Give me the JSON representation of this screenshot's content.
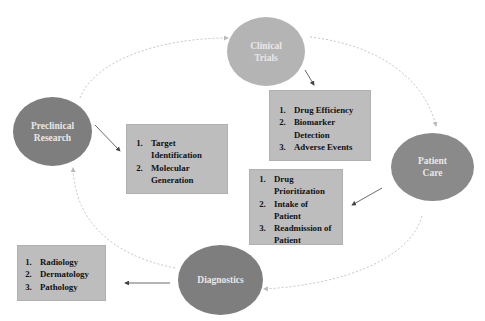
{
  "diagram": {
    "nodes": [
      {
        "id": "clinical-trials",
        "label_line1": "Clinical",
        "label_line2": "Trials",
        "color": "#b4b4b4"
      },
      {
        "id": "preclinical-research",
        "label_line1": "Preclinical",
        "label_line2": "Research",
        "color": "#7e7e7e"
      },
      {
        "id": "patient-care",
        "label_line1": "Patient",
        "label_line2": "Care",
        "color": "#8a8a8a"
      },
      {
        "id": "diagnostics",
        "label_line1": "Diagnostics",
        "label_line2": "",
        "color": "#7e7e7e"
      }
    ],
    "boxes": {
      "clinical_trials": [
        "Drug Efficiency",
        "Biomarker Detection",
        "Adverse Events"
      ],
      "preclinical_research": [
        "Target Identification",
        "Molecular Generation"
      ],
      "patient_care": [
        "Drug Prioritization",
        "Intake of Patient",
        "Readmission of Patient"
      ],
      "diagnostics": [
        "Radiology",
        "Dermatology",
        "Pathology"
      ]
    },
    "colors": {
      "box_bg": "#bdbdbd",
      "cycle_line": "#c8c8c8",
      "arrow": "#444444"
    }
  }
}
